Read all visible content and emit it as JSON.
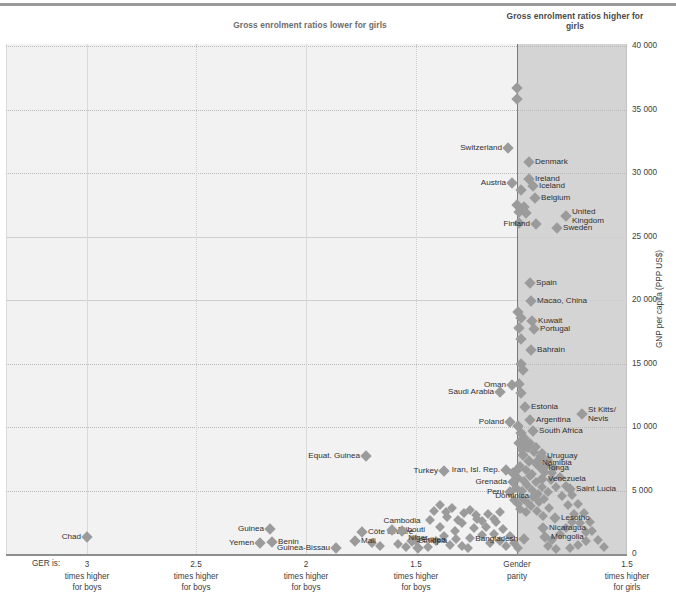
{
  "headings": {
    "lower": "Gross enrolment ratios lower for girls",
    "higher": "Gross enrolment ratios higher for girls"
  },
  "axes": {
    "y_label": "GNP per capita (PPP US$)",
    "y_ticks": [
      "40 000",
      "35 000",
      "30 000",
      "25 000",
      "20 000",
      "15 000",
      "10 000",
      "5 000",
      "0"
    ],
    "y_values": [
      40000,
      35000,
      30000,
      25000,
      20000,
      15000,
      10000,
      5000,
      0
    ],
    "x_prefix": "GER is:",
    "x_ticks": [
      {
        "value": "3",
        "line1": "times higher",
        "line2": "for boys"
      },
      {
        "value": "2.5",
        "line1": "times higher",
        "line2": "for boys"
      },
      {
        "value": "2",
        "line1": "times higher",
        "line2": "for boys"
      },
      {
        "value": "1.5",
        "line1": "times higher",
        "line2": "for boys"
      },
      {
        "value": "Gender",
        "line1": "parity",
        "line2": ""
      },
      {
        "value": "1.5",
        "line1": "times higher",
        "line2": "for girls"
      }
    ]
  },
  "chart_data": {
    "type": "scatter",
    "title": "",
    "xlabel": "GER is: times higher for boys / Gender parity / times higher for girls",
    "ylabel": "GNP per capita (PPP US$)",
    "ylim": [
      0,
      40000
    ],
    "xlim_ticks": [
      "3 times higher for boys",
      "2.5 times higher for boys",
      "2 times higher for boys",
      "1.5 times higher for boys",
      "Gender parity",
      "1.5 times higher for girls"
    ],
    "grid": true,
    "legend": "none",
    "shaded_region": {
      "label": "Gross enrolment ratios higher for girls",
      "from": "Gender parity",
      "to": "1.5 times higher for girls",
      "color": "#d4d4d4"
    },
    "marker_color": "#9b9b9b",
    "points": [
      {
        "label": "",
        "px": 517,
        "py": 88
      },
      {
        "label": "",
        "px": 517,
        "py": 99
      },
      {
        "label": "Switzerland",
        "px": 508,
        "py": 148,
        "side": "r"
      },
      {
        "label": "Denmark",
        "px": 529,
        "py": 162,
        "side": "l"
      },
      {
        "label": "Ireland",
        "px": 529,
        "py": 179,
        "side": "l"
      },
      {
        "label": "Iceland",
        "px": 533,
        "py": 186,
        "side": "l"
      },
      {
        "label": "Austria",
        "px": 512,
        "py": 183,
        "side": "r"
      },
      {
        "label": "",
        "px": 521,
        "py": 190
      },
      {
        "label": "Belgium",
        "px": 535,
        "py": 198,
        "side": "l"
      },
      {
        "label": "",
        "px": 517,
        "py": 205
      },
      {
        "label": "",
        "px": 524,
        "py": 207
      },
      {
        "label": "",
        "px": 519,
        "py": 212
      },
      {
        "label": "",
        "px": 526,
        "py": 213
      },
      {
        "label": "United Kingdom",
        "px": 566,
        "py": 216,
        "side": "l",
        "two": true
      },
      {
        "label": "",
        "px": 519,
        "py": 223
      },
      {
        "label": "Finland",
        "px": 536,
        "py": 224,
        "side": "r"
      },
      {
        "label": "Sweden",
        "px": 557,
        "py": 228,
        "side": "l"
      },
      {
        "label": "Spain",
        "px": 530,
        "py": 283,
        "side": "l"
      },
      {
        "label": "Macao, China",
        "px": 531,
        "py": 301,
        "side": "l"
      },
      {
        "label": "",
        "px": 518,
        "py": 312
      },
      {
        "label": "",
        "px": 521,
        "py": 318
      },
      {
        "label": "Kuwait",
        "px": 532,
        "py": 321,
        "side": "l"
      },
      {
        "label": "Portugal",
        "px": 534,
        "py": 329,
        "side": "l"
      },
      {
        "label": "",
        "px": 519,
        "py": 328
      },
      {
        "label": "",
        "px": 521,
        "py": 339
      },
      {
        "label": "Bahrain",
        "px": 531,
        "py": 350,
        "side": "l"
      },
      {
        "label": "",
        "px": 521,
        "py": 364
      },
      {
        "label": "",
        "px": 523,
        "py": 370
      },
      {
        "label": "Oman",
        "px": 512,
        "py": 385,
        "side": "r"
      },
      {
        "label": "",
        "px": 519,
        "py": 384
      },
      {
        "label": "Saudi Arabia",
        "px": 500,
        "py": 392,
        "side": "r"
      },
      {
        "label": "",
        "px": 521,
        "py": 393
      },
      {
        "label": "Estonia",
        "px": 525,
        "py": 407,
        "side": "l"
      },
      {
        "label": "St Kitts/ Nevis",
        "px": 582,
        "py": 414,
        "side": "l",
        "two": true
      },
      {
        "label": "Poland",
        "px": 510,
        "py": 422,
        "side": "r"
      },
      {
        "label": "Argentina",
        "px": 530,
        "py": 420,
        "side": "l"
      },
      {
        "label": "South Africa",
        "px": 533,
        "py": 431,
        "side": "l"
      },
      {
        "label": "",
        "px": 518,
        "py": 426
      },
      {
        "label": "",
        "px": 521,
        "py": 433
      },
      {
        "label": "",
        "px": 524,
        "py": 438
      },
      {
        "label": "",
        "px": 519,
        "py": 443
      },
      {
        "label": "",
        "px": 527,
        "py": 446
      },
      {
        "label": "Equat. Guinea",
        "px": 366,
        "py": 456,
        "side": "r"
      },
      {
        "label": "Uruguay",
        "px": 541,
        "py": 456,
        "side": "l"
      },
      {
        "label": "Namibia",
        "px": 536,
        "py": 463,
        "side": "l"
      },
      {
        "label": "",
        "px": 523,
        "py": 455
      },
      {
        "label": "",
        "px": 529,
        "py": 461
      },
      {
        "label": "Tonga",
        "px": 541,
        "py": 468,
        "side": "l"
      },
      {
        "label": "Turkey",
        "px": 444,
        "py": 471,
        "side": "r"
      },
      {
        "label": "Iran, Isl. Rep.",
        "px": 506,
        "py": 470,
        "side": "r"
      },
      {
        "label": "",
        "px": 513,
        "py": 473
      },
      {
        "label": "",
        "px": 518,
        "py": 469
      },
      {
        "label": "Venezuela",
        "px": 542,
        "py": 479,
        "side": "l"
      },
      {
        "label": "Grenada",
        "px": 513,
        "py": 482,
        "side": "r"
      },
      {
        "label": "Saint Lucia",
        "px": 570,
        "py": 489,
        "side": "l"
      },
      {
        "label": "Peru",
        "px": 510,
        "py": 492,
        "side": "r"
      },
      {
        "label": "Dominica",
        "px": 535,
        "py": 496,
        "side": "r"
      },
      {
        "label": "Lesotho",
        "px": 555,
        "py": 518,
        "side": "l"
      },
      {
        "label": "Nicaragua",
        "px": 543,
        "py": 528,
        "side": "l"
      },
      {
        "label": "Mongolia",
        "px": 545,
        "py": 537,
        "side": "l"
      },
      {
        "label": "Bangladesh",
        "px": 524,
        "py": 539,
        "side": "r"
      },
      {
        "label": "Chad",
        "px": 87,
        "py": 537,
        "side": "r"
      },
      {
        "label": "Guinea",
        "px": 270,
        "py": 529,
        "side": "r"
      },
      {
        "label": "Yemen",
        "px": 260,
        "py": 543,
        "side": "r"
      },
      {
        "label": "Benin",
        "px": 272,
        "py": 542,
        "side": "l"
      },
      {
        "label": "Guinea-Bissau",
        "px": 336,
        "py": 548,
        "side": "r"
      },
      {
        "label": "Côte d'Ivoire",
        "px": 362,
        "py": 532,
        "side": "l"
      },
      {
        "label": "Mali",
        "px": 355,
        "py": 541,
        "side": "l"
      },
      {
        "label": "Djibouti",
        "px": 392,
        "py": 530,
        "side": "l"
      },
      {
        "label": "Cambodia",
        "px": 402,
        "py": 531,
        "side": "c"
      },
      {
        "label": "Ethiopia",
        "px": 412,
        "py": 541,
        "side": "l"
      },
      {
        "label": "Eritrea",
        "px": 416,
        "py": 540,
        "side": "l"
      },
      {
        "label": "Niger",
        "px": 418,
        "py": 548,
        "side": "c"
      }
    ],
    "unlabeled_points": [
      [
        430,
        520
      ],
      [
        440,
        527
      ],
      [
        447,
        517
      ],
      [
        455,
        531
      ],
      [
        462,
        523
      ],
      [
        470,
        538
      ],
      [
        436,
        541
      ],
      [
        450,
        545
      ],
      [
        462,
        546
      ],
      [
        474,
        528
      ],
      [
        482,
        535
      ],
      [
        490,
        543
      ],
      [
        428,
        547
      ],
      [
        444,
        536
      ],
      [
        456,
        539
      ],
      [
        468,
        548
      ],
      [
        477,
        519
      ],
      [
        486,
        527
      ],
      [
        494,
        534
      ],
      [
        500,
        541
      ],
      [
        506,
        546
      ],
      [
        496,
        522
      ],
      [
        503,
        529
      ],
      [
        510,
        536
      ],
      [
        514,
        543
      ],
      [
        518,
        548
      ],
      [
        398,
        544
      ],
      [
        406,
        547
      ],
      [
        380,
        546
      ],
      [
        372,
        543
      ],
      [
        520,
        509
      ],
      [
        526,
        512
      ],
      [
        531,
        506
      ],
      [
        537,
        511
      ],
      [
        543,
        516
      ],
      [
        549,
        508
      ],
      [
        514,
        500
      ],
      [
        518,
        504
      ],
      [
        523,
        499
      ],
      [
        528,
        503
      ],
      [
        533,
        497
      ],
      [
        539,
        502
      ],
      [
        516,
        488
      ],
      [
        522,
        491
      ],
      [
        527,
        485
      ],
      [
        532,
        490
      ],
      [
        538,
        494
      ],
      [
        544,
        499
      ],
      [
        518,
        478
      ],
      [
        524,
        481
      ],
      [
        530,
        476
      ],
      [
        536,
        482
      ],
      [
        542,
        487
      ],
      [
        548,
        492
      ],
      [
        520,
        466
      ],
      [
        526,
        470
      ],
      [
        532,
        474
      ],
      [
        538,
        463
      ],
      [
        545,
        472
      ],
      [
        551,
        480
      ],
      [
        522,
        450
      ],
      [
        528,
        448
      ],
      [
        534,
        452
      ],
      [
        540,
        458
      ],
      [
        546,
        466
      ],
      [
        552,
        473
      ],
      [
        524,
        440
      ],
      [
        530,
        443
      ],
      [
        536,
        447
      ],
      [
        542,
        453
      ],
      [
        548,
        460
      ],
      [
        554,
        468
      ],
      [
        556,
        487
      ],
      [
        562,
        496
      ],
      [
        568,
        505
      ],
      [
        574,
        514
      ],
      [
        580,
        523
      ],
      [
        586,
        532
      ],
      [
        560,
        477
      ],
      [
        566,
        486
      ],
      [
        572,
        495
      ],
      [
        578,
        504
      ],
      [
        584,
        513
      ],
      [
        590,
        522
      ],
      [
        592,
        531
      ],
      [
        598,
        540
      ],
      [
        604,
        547
      ],
      [
        586,
        541
      ],
      [
        578,
        545
      ],
      [
        570,
        548
      ],
      [
        552,
        540
      ],
      [
        560,
        534
      ],
      [
        566,
        528
      ],
      [
        572,
        522
      ],
      [
        548,
        546
      ],
      [
        556,
        549
      ],
      [
        500,
        512
      ],
      [
        494,
        519
      ],
      [
        488,
        514
      ],
      [
        482,
        521
      ],
      [
        476,
        515
      ],
      [
        470,
        510
      ],
      [
        464,
        513
      ],
      [
        458,
        520
      ],
      [
        452,
        508
      ],
      [
        446,
        512
      ],
      [
        440,
        505
      ],
      [
        434,
        511
      ]
    ]
  }
}
